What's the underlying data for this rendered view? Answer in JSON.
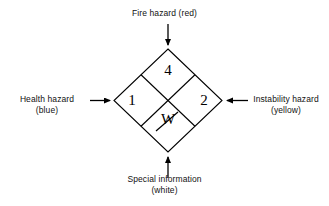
{
  "diagram": {
    "ratings": {
      "fire": "4",
      "health": "1",
      "instability": "2",
      "special": "W"
    },
    "labels": {
      "fire": {
        "line1": "Fire hazard (red)"
      },
      "health": {
        "line1": "Health hazard",
        "line2": "(blue)"
      },
      "instability": {
        "line1": "Instability hazard",
        "line2": "(yellow)"
      },
      "special": {
        "line1": "Special information",
        "line2": "(white)"
      }
    },
    "icons": {
      "arrow_top": "arrow-down-icon",
      "arrow_left": "arrow-right-icon",
      "arrow_right": "arrow-left-icon",
      "arrow_bottom": "arrow-up-icon",
      "special_symbol": "w-with-slash-icon"
    },
    "colors": {
      "stroke": "#000000",
      "background": "#ffffff",
      "text": "#111111"
    }
  }
}
